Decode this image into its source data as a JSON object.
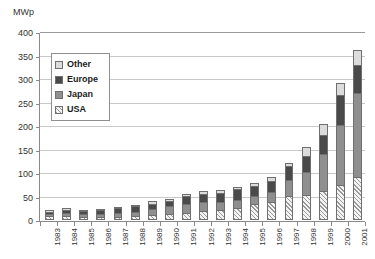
{
  "chart_data": {
    "type": "bar",
    "title": "",
    "subtitle": "",
    "xlabel": "",
    "ylabel": "MWp",
    "stacked": true,
    "grid": true,
    "legend_position": "inside-top-left",
    "ylim": [
      0,
      400
    ],
    "ytick_step": 50,
    "ytick_labels": [
      "0",
      "50",
      "100",
      "150",
      "200",
      "250",
      "300",
      "350",
      "400"
    ],
    "ytick_values": [
      0,
      50,
      100,
      150,
      200,
      250,
      300,
      350,
      400
    ],
    "categories": [
      "1983",
      "1984",
      "1985",
      "1986",
      "1987",
      "1988",
      "1989",
      "1990",
      "1991",
      "1992",
      "1993",
      "1994",
      "1995",
      "1996",
      "1997",
      "1998",
      "1999",
      "2000",
      "2001"
    ],
    "series": [
      {
        "name": "USA",
        "pattern": "diagonal-hatch",
        "color": "#f2f2f2",
        "values": [
          8,
          9,
          7,
          7,
          7,
          8,
          10,
          12,
          15,
          19,
          22,
          26,
          35,
          39,
          51,
          54,
          61,
          75,
          91
        ]
      },
      {
        "name": "Japan",
        "pattern": "solid",
        "color": "#8f8f8f",
        "values": [
          4,
          5,
          5,
          6,
          7,
          9,
          13,
          17,
          20,
          19,
          17,
          17,
          17,
          21,
          35,
          49,
          80,
          128,
          179
        ]
      },
      {
        "name": "Europe",
        "pattern": "solid",
        "color": "#4a4a4a",
        "values": [
          6,
          8,
          7,
          8,
          11,
          12,
          12,
          11,
          16,
          18,
          19,
          22,
          20,
          24,
          30,
          34,
          40,
          62,
          60
        ]
      },
      {
        "name": "Other",
        "pattern": "solid",
        "color": "#dcdcdc",
        "values": [
          3,
          3,
          2,
          3,
          3,
          4,
          5,
          5,
          5,
          5,
          5,
          5,
          7,
          8,
          5,
          18,
          24,
          26,
          32
        ]
      }
    ],
    "totals": [
      21,
      25,
      21,
      24,
      28,
      33,
      40,
      45,
      56,
      61,
      63,
      70,
      79,
      92,
      121,
      155,
      205,
      291,
      362
    ]
  },
  "legend": {
    "items": [
      {
        "label": "Other",
        "swatch": "light-gray-swatch"
      },
      {
        "label": "Europe",
        "swatch": "dark-gray-swatch"
      },
      {
        "label": "Japan",
        "swatch": "medium-gray-swatch"
      },
      {
        "label": "USA",
        "swatch": "hatched-swatch"
      }
    ]
  }
}
